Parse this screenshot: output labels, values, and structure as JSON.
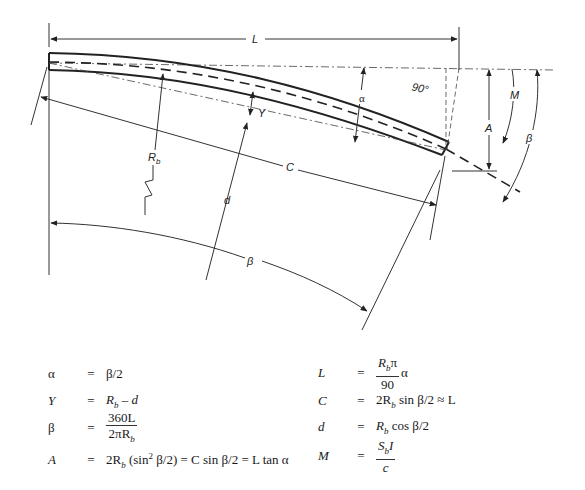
{
  "diagram": {
    "labels": {
      "L": "L",
      "alpha": "α",
      "ninety": "90°",
      "M": "M",
      "A": "A",
      "beta_right": "β",
      "Rb": "R",
      "Rb_sub": "b",
      "Y": "Y",
      "C": "C",
      "d": "d",
      "beta_bottom": "β"
    }
  },
  "equations": {
    "left": [
      {
        "lhs": "α",
        "op": "=",
        "rhs": "β/2"
      },
      {
        "lhs": "Y",
        "op": "=",
        "rhs_a": "R",
        "rhs_sub": "b",
        "rhs_b": " – d"
      },
      {
        "lhs": "β",
        "op": "=",
        "num": "360L",
        "den_a": "2πR",
        "den_sub": "b"
      },
      {
        "lhs": "A",
        "op": "=",
        "rhs_a": "2R",
        "rhs_sub": "b",
        "rhs_b": " (sin",
        "rhs_sup": "2",
        "rhs_c": " β/2) = C sin β/2 = L tan α"
      }
    ],
    "right": [
      {
        "lhs": "L",
        "op": "=",
        "num_a": "R",
        "num_sub": "b",
        "num_b": "π",
        "den": "90",
        "tail": "α"
      },
      {
        "lhs": "C",
        "op": "=",
        "rhs_a": "2R",
        "rhs_sub": "b",
        "rhs_b": " sin β/2 ≈  L"
      },
      {
        "lhs": "d",
        "op": "=",
        "rhs_a": "R",
        "rhs_sub": "b",
        "rhs_b": " cos β/2"
      },
      {
        "lhs": "M",
        "op": "=",
        "num_a": "S",
        "num_sub": "b",
        "num_b": "I",
        "den": "c"
      }
    ]
  }
}
